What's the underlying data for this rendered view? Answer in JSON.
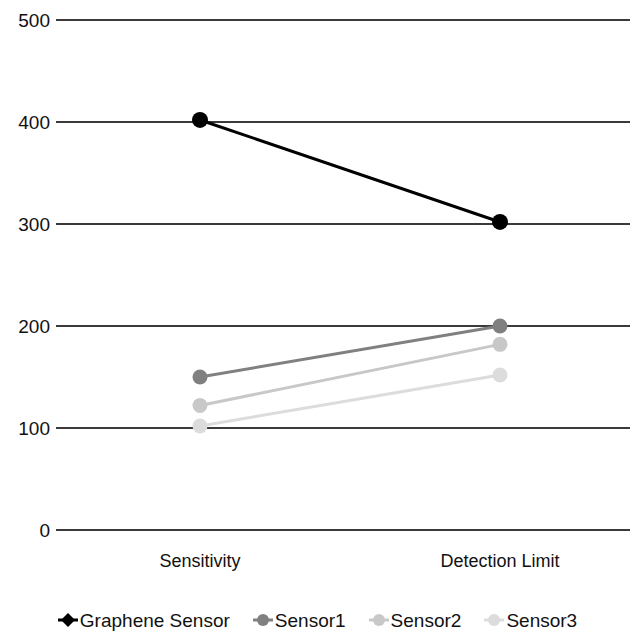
{
  "chart_data": {
    "type": "line",
    "title": "",
    "subtitle": "",
    "xlabel": "",
    "ylabel": "",
    "categories": [
      "Sensitivity",
      "Detection Limit"
    ],
    "ylim": [
      0,
      500
    ],
    "ytick_labels": [
      "500",
      "400",
      "300",
      "200",
      "100",
      "0"
    ],
    "ytick_values": [
      500,
      400,
      300,
      200,
      100,
      0
    ],
    "grid": true,
    "legend_position": "bottom",
    "series": [
      {
        "name": "Graphene Sensor",
        "values": [
          402,
          302
        ],
        "color": "#000000",
        "marker": "diamond"
      },
      {
        "name": "Sensor1",
        "values": [
          150,
          200
        ],
        "color": "#808080",
        "marker": "circle"
      },
      {
        "name": "Sensor2",
        "values": [
          122,
          182
        ],
        "color": "#c8c8c8",
        "marker": "circle"
      },
      {
        "name": "Sensor3",
        "values": [
          102,
          152
        ],
        "color": "#dcdcdc",
        "marker": "circle"
      }
    ]
  },
  "axes": {
    "gridline_color": "#3a3a3a",
    "ytick_0": "500",
    "ytick_1": "400",
    "ytick_2": "300",
    "ytick_3": "200",
    "ytick_4": "100",
    "ytick_5": "0",
    "xtick_0": "Sensitivity",
    "xtick_1": "Detection Limit"
  },
  "legend": {
    "items": [
      {
        "label": "Graphene Sensor",
        "color": "#000000",
        "marker": "diamond-marker"
      },
      {
        "label": "Sensor1",
        "color": "#808080",
        "marker": "circle-marker"
      },
      {
        "label": "Sensor2",
        "color": "#c8c8c8",
        "marker": "circle-marker"
      },
      {
        "label": "Sensor3",
        "color": "#dcdcdc",
        "marker": "circle-marker"
      }
    ]
  }
}
